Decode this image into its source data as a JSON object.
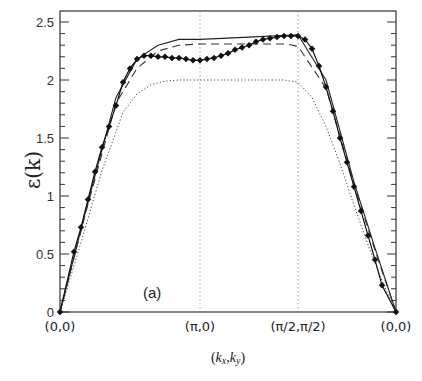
{
  "chart_data": {
    "type": "line",
    "title": "",
    "panel_label": "(a)",
    "xlabel": "(k_x,k_y)",
    "ylabel": "ε(k)",
    "ylim": [
      0,
      2.6
    ],
    "yticks": [
      0,
      0.5,
      1,
      1.5,
      2,
      2.5
    ],
    "ytick_labels": [
      "0",
      "0.5",
      "1",
      "1.5",
      "2",
      "2.5"
    ],
    "minor_ytick_step": 0.1,
    "x_path": {
      "points": [
        "(0,0)",
        "(π,0)",
        "(π/2,π/2)",
        "(0,0)"
      ],
      "positions": [
        0,
        1,
        1.7,
        2.4
      ]
    },
    "vertical_guides_at": [
      1,
      1.7
    ],
    "grid": false,
    "legend": null,
    "series": [
      {
        "name": "solid",
        "style": "solid",
        "x": [
          0,
          0.2,
          0.4,
          0.55,
          0.7,
          0.85,
          1.0,
          1.35,
          1.7,
          1.9,
          2.1,
          2.25,
          2.4
        ],
        "values": [
          0,
          0.95,
          1.85,
          2.18,
          2.3,
          2.35,
          2.35,
          2.37,
          2.39,
          2.0,
          1.12,
          0.55,
          0
        ]
      },
      {
        "name": "dashed",
        "style": "dashed",
        "x": [
          0,
          0.2,
          0.4,
          0.55,
          0.7,
          0.85,
          1.0,
          1.35,
          1.62,
          1.7,
          1.9,
          2.1,
          2.25,
          2.4
        ],
        "values": [
          0,
          0.93,
          1.8,
          2.1,
          2.25,
          2.3,
          2.31,
          2.31,
          2.31,
          2.29,
          1.93,
          1.1,
          0.53,
          0
        ]
      },
      {
        "name": "dotted",
        "style": "dotted",
        "x": [
          0,
          0.15,
          0.3,
          0.45,
          0.55,
          0.65,
          0.75,
          0.85,
          1.0,
          1.35,
          1.6,
          1.7,
          1.8,
          1.9,
          2.0,
          2.1,
          2.2,
          2.3,
          2.4
        ],
        "values": [
          0,
          0.6,
          1.22,
          1.72,
          1.88,
          1.96,
          1.99,
          2.0,
          2.0,
          2.0,
          2.0,
          1.98,
          1.85,
          1.6,
          1.28,
          0.92,
          0.58,
          0.27,
          0
        ]
      },
      {
        "name": "points",
        "style": "markers",
        "x": [
          0,
          0.1,
          0.15,
          0.2,
          0.25,
          0.3,
          0.35,
          0.4,
          0.45,
          0.5,
          0.55,
          0.6,
          0.65,
          0.7,
          0.75,
          0.8,
          0.85,
          0.9,
          0.95,
          1.0,
          1.05,
          1.1,
          1.15,
          1.2,
          1.25,
          1.3,
          1.35,
          1.4,
          1.45,
          1.5,
          1.55,
          1.6,
          1.65,
          1.7,
          1.75,
          1.8,
          1.85,
          1.9,
          1.95,
          2.0,
          2.05,
          2.1,
          2.15,
          2.2,
          2.25,
          2.3,
          2.4
        ],
        "values": [
          0,
          0.52,
          0.73,
          0.97,
          1.21,
          1.42,
          1.6,
          1.78,
          1.98,
          2.1,
          2.18,
          2.21,
          2.21,
          2.2,
          2.2,
          2.19,
          2.19,
          2.18,
          2.17,
          2.17,
          2.18,
          2.19,
          2.21,
          2.23,
          2.26,
          2.28,
          2.3,
          2.33,
          2.35,
          2.36,
          2.37,
          2.38,
          2.38,
          2.38,
          2.35,
          2.27,
          2.12,
          1.94,
          1.73,
          1.5,
          1.29,
          1.08,
          0.87,
          0.66,
          0.45,
          0.23,
          0
        ]
      }
    ]
  }
}
